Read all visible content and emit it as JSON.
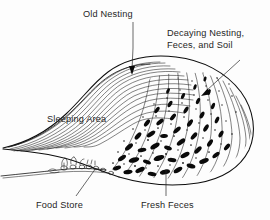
{
  "figure": {
    "background_color": "#fdfdfd",
    "ink_color": "#0d0d0d"
  },
  "labels": {
    "old_nesting": "Old Nesting",
    "decaying_line1": "Decaying Nesting,",
    "decaying_line2": "Feces, and Soil",
    "sleeping_area": "Sleeping Area",
    "food_store": "Food Store",
    "fresh_feces": "Fresh Feces"
  },
  "annotations": [
    {
      "name": "old-nesting",
      "text": "Old Nesting",
      "text_x": 83,
      "text_y": 17,
      "leader": "M133,22 L133,48 L132,70",
      "arrow": "M132,74 L129.2,66.5 L134.8,66.5 Z"
    },
    {
      "name": "decaying-nesting",
      "text_line1": "Decaying Nesting,",
      "text_line2": "Feces, and Soil",
      "text_x": 167,
      "text_y": 36,
      "leader": "M238,62 L205,92",
      "arrow": "M201,95 L206.4,89.2 L208.9,94.2 Z"
    },
    {
      "name": "sleeping-area",
      "text": "Sleeping Area",
      "text_x": 47,
      "text_y": 120,
      "leader": "",
      "arrow": ""
    },
    {
      "name": "food-store",
      "text": "Food Store",
      "text_x": 36,
      "text_y": 207,
      "leader": "M78,193 L96,168",
      "arrow": ""
    },
    {
      "name": "fresh-feces",
      "text": "Fresh Feces",
      "text_x": 141,
      "text_y": 207,
      "leader": "M166,194 L166,170",
      "arrow": ""
    }
  ],
  "regions": {
    "nesting_strands_count": 14,
    "decay_strands_count": 13,
    "feces_blob_count": 46,
    "soil_dot_count": 54
  }
}
